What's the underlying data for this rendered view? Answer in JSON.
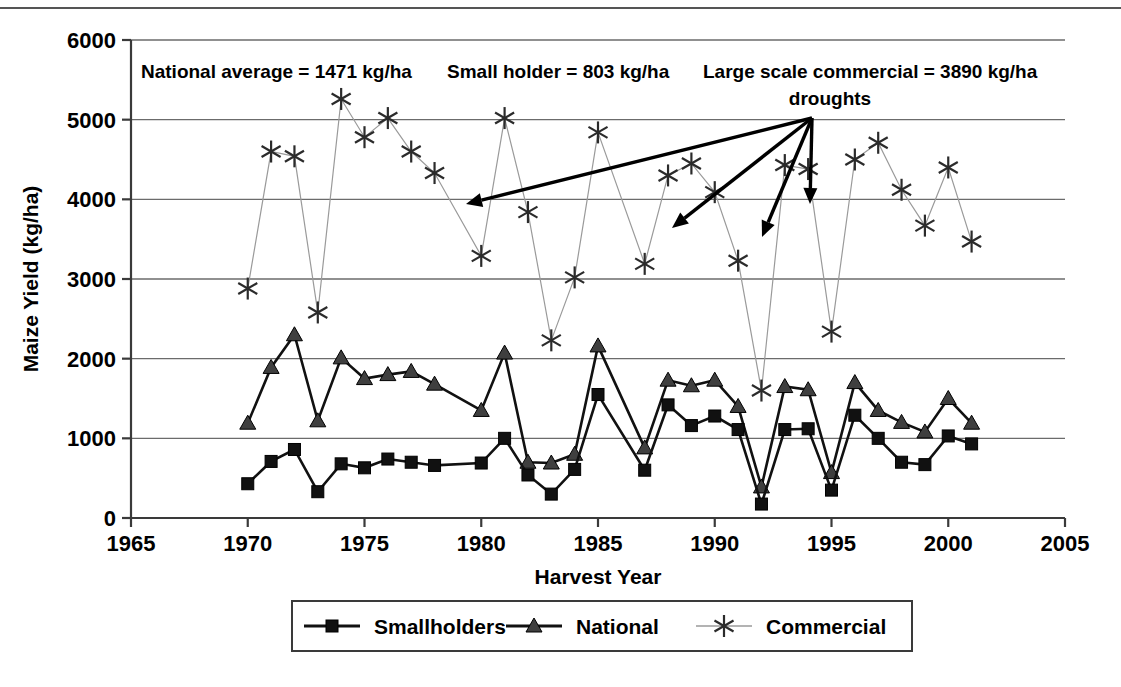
{
  "chart_data": {
    "type": "line",
    "title": "",
    "xlabel": "Harvest Year",
    "ylabel": "Maize Yield (kg/ha)",
    "xlim": [
      1965,
      2005
    ],
    "ylim": [
      0,
      6000
    ],
    "xticks": [
      1965,
      1970,
      1975,
      1980,
      1985,
      1990,
      1995,
      2000,
      2005
    ],
    "yticks": [
      0,
      1000,
      2000,
      3000,
      4000,
      5000,
      6000
    ],
    "grid": "horizontal",
    "legend_position": "bottom",
    "series": [
      {
        "name": "Smallholders",
        "marker": "square",
        "color": "#111111",
        "line_color": "#111111",
        "x": [
          1970,
          1971,
          1972,
          1973,
          1974,
          1975,
          1976,
          1977,
          1978,
          1980,
          1981,
          1982,
          1983,
          1984,
          1985,
          1987,
          1988,
          1989,
          1990,
          1991,
          1992,
          1993,
          1994,
          1995,
          1996,
          1997,
          1998,
          1999,
          2000,
          2001
        ],
        "values": [
          430,
          710,
          860,
          330,
          680,
          630,
          740,
          700,
          660,
          690,
          1000,
          540,
          300,
          610,
          1550,
          600,
          1420,
          1160,
          1280,
          1110,
          175,
          1110,
          1120,
          350,
          1290,
          1000,
          700,
          670,
          1030,
          930
        ]
      },
      {
        "name": "National",
        "marker": "triangle",
        "color": "#3f3f3f",
        "line_color": "#111111",
        "x": [
          1970,
          1971,
          1972,
          1973,
          1974,
          1975,
          1976,
          1977,
          1978,
          1980,
          1981,
          1982,
          1983,
          1984,
          1985,
          1987,
          1988,
          1989,
          1990,
          1991,
          1992,
          1993,
          1994,
          1995,
          1996,
          1997,
          1998,
          1999,
          2000,
          2001
        ],
        "values": [
          1190,
          1890,
          2300,
          1220,
          2010,
          1750,
          1800,
          1840,
          1680,
          1350,
          2070,
          700,
          690,
          800,
          2160,
          880,
          1730,
          1660,
          1730,
          1400,
          390,
          1650,
          1610,
          570,
          1700,
          1350,
          1200,
          1080,
          1500,
          1190
        ]
      },
      {
        "name": "Commercial",
        "marker": "asterisk",
        "color": "#2b2b2b",
        "line_color": "#9a9a9a",
        "x": [
          1970,
          1971,
          1972,
          1973,
          1974,
          1975,
          1976,
          1977,
          1978,
          1980,
          1981,
          1982,
          1983,
          1984,
          1985,
          1987,
          1988,
          1989,
          1990,
          1991,
          1992,
          1993,
          1994,
          1995,
          1996,
          1997,
          1998,
          1999,
          2000,
          2001
        ],
        "values": [
          2880,
          4600,
          4540,
          2580,
          5260,
          4780,
          5020,
          4600,
          4330,
          3290,
          5020,
          3840,
          2230,
          3020,
          4840,
          3190,
          4300,
          4450,
          4090,
          3230,
          1600,
          4430,
          4380,
          2340,
          4500,
          4710,
          4120,
          3670,
          4400,
          3470
        ]
      }
    ],
    "annotations": {
      "stats": [
        {
          "id": "national-average",
          "text": "National average = 1471 kg/ha"
        },
        {
          "id": "small-holder",
          "text": "Small holder = 803 kg/ha"
        },
        {
          "id": "large-scale-commercial",
          "text": "Large scale commercial = 3890 kg/ha"
        }
      ],
      "drought_label": "droughts",
      "drought_years": [
        1983,
        1987,
        1992,
        1995
      ]
    }
  },
  "axes": {
    "y_title": "Maize Yield (kg/ha)",
    "x_title": "Harvest Year",
    "y_tick_labels": [
      "0",
      "1000",
      "2000",
      "3000",
      "4000",
      "5000",
      "6000"
    ],
    "x_tick_labels": [
      "1965",
      "1970",
      "1975",
      "1980",
      "1985",
      "1990",
      "1995",
      "2000",
      "2005"
    ]
  },
  "legend": {
    "items": [
      {
        "label": "Smallholders",
        "marker": "square"
      },
      {
        "label": "National",
        "marker": "triangle"
      },
      {
        "label": "Commercial",
        "marker": "asterisk"
      }
    ]
  }
}
